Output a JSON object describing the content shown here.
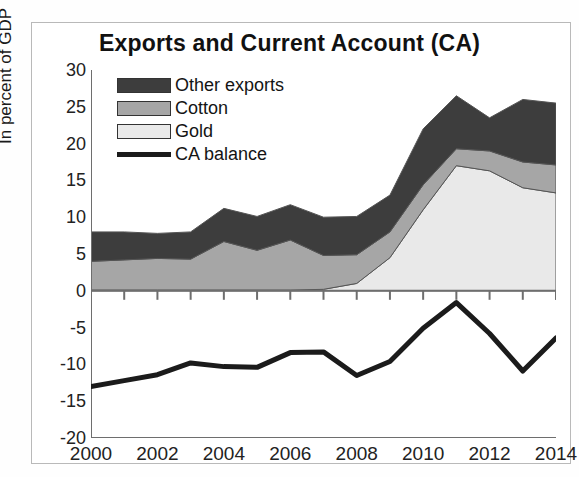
{
  "figure": {
    "title": "Exports and Current Account  (CA)",
    "ylabel": "In percent of GDP"
  },
  "legend": {
    "items": [
      {
        "label": "Other exports",
        "type": "area",
        "color": "#3d3d3d"
      },
      {
        "label": "Cotton",
        "type": "area",
        "color": "#a6a6a6"
      },
      {
        "label": "Gold",
        "type": "area",
        "color": "#e9e9e9"
      },
      {
        "label": "CA balance",
        "type": "line",
        "color": "#1b1b1b"
      }
    ]
  },
  "axes": {
    "y_ticks": [
      "30",
      "25",
      "20",
      "15",
      "10",
      "5",
      "0",
      "-5",
      "-10",
      "-15",
      "-20"
    ],
    "x_ticks": [
      "2000",
      "2002",
      "2004",
      "2006",
      "2008",
      "2010",
      "2012",
      "2014"
    ]
  },
  "chart_data": {
    "type": "area",
    "title": "Exports and Current Account  (CA)",
    "xlabel": "",
    "ylabel": "In percent of GDP",
    "xlim": [
      2000,
      2014
    ],
    "ylim": [
      -20,
      30
    ],
    "ytick_step": 5,
    "grid": false,
    "legend_position": "top-left",
    "stacked": true,
    "x": [
      2000,
      2001,
      2002,
      2003,
      2004,
      2005,
      2006,
      2007,
      2008,
      2009,
      2010,
      2011,
      2012,
      2013,
      2014
    ],
    "series": [
      {
        "name": "Gold",
        "kind": "area",
        "color": "#e9e9e9",
        "values": [
          0.1,
          0.1,
          0.1,
          0.1,
          0.1,
          0.1,
          0.1,
          0.2,
          1.0,
          4.5,
          11.0,
          17.0,
          16.3,
          14.0,
          13.3
        ]
      },
      {
        "name": "Cotton",
        "kind": "area",
        "color": "#a6a6a6",
        "values": [
          3.9,
          4.1,
          4.3,
          4.2,
          6.6,
          5.4,
          6.8,
          4.6,
          3.9,
          3.5,
          3.4,
          2.3,
          2.7,
          3.5,
          3.8
        ]
      },
      {
        "name": "Other exports",
        "kind": "area",
        "color": "#3d3d3d",
        "values": [
          4.0,
          3.8,
          3.4,
          3.7,
          4.5,
          4.6,
          4.8,
          5.2,
          5.2,
          5.0,
          7.6,
          7.2,
          4.5,
          8.5,
          8.4
        ]
      },
      {
        "name": "CA balance",
        "kind": "line",
        "color": "#1b1b1b",
        "values": [
          -13.0,
          -12.2,
          -11.4,
          -9.8,
          -10.3,
          -10.4,
          -8.4,
          -8.3,
          -11.5,
          -9.6,
          -5.1,
          -1.6,
          -5.8,
          -10.9,
          -6.4
        ]
      }
    ],
    "stack_totals": [
      8.0,
      8.0,
      7.8,
      8.0,
      11.2,
      10.1,
      11.7,
      10.0,
      10.1,
      13.0,
      22.0,
      26.5,
      23.5,
      26.0,
      25.5
    ]
  }
}
